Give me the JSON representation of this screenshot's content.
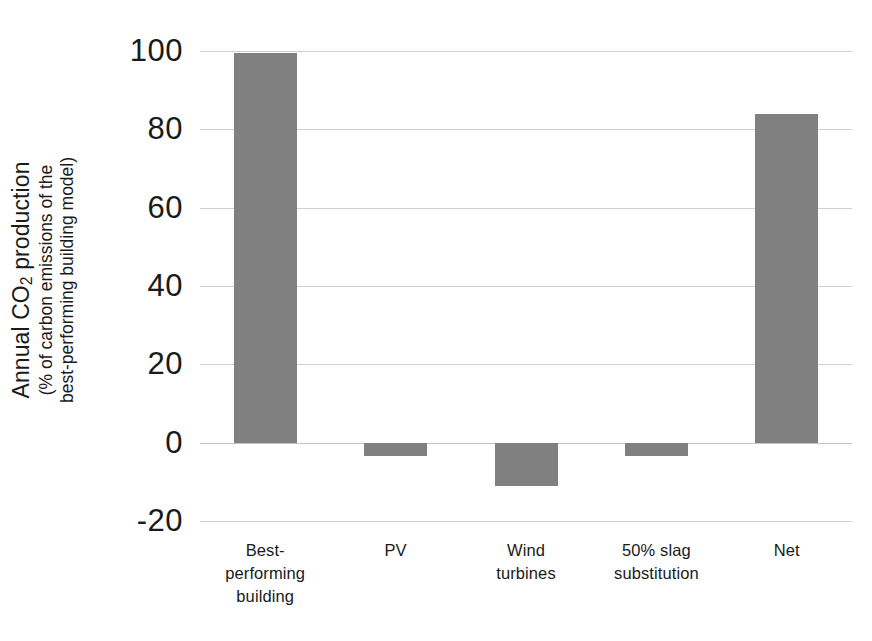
{
  "chart_data": {
    "type": "bar",
    "title": "",
    "subtitle": "",
    "xlabel": "",
    "ylabel_line1": "Annual CO",
    "ylabel_line1_sub": "2",
    "ylabel_line1_rest": " production",
    "ylabel_line2": "(% of carbon emissions of the",
    "ylabel_line3": "best-performing building model)",
    "categories": [
      "Best-\nperforming\nbuilding",
      "PV",
      "Wind\nturbines",
      "50% slag\nsubstitution",
      "Net"
    ],
    "values": [
      99.5,
      -3.5,
      -11,
      -3.5,
      84
    ],
    "ylim": [
      -20,
      100
    ],
    "yticks": [
      100,
      80,
      60,
      40,
      20,
      0,
      -20
    ],
    "ytick_labels": [
      "100",
      "80",
      "60",
      "40",
      "20",
      "0",
      "-20"
    ],
    "grid": true,
    "legend": "none",
    "bar_color": "#808080",
    "grid_color": "#cfcfcf",
    "text_color": "#1a1a1a",
    "background_color": "#ffffff"
  }
}
